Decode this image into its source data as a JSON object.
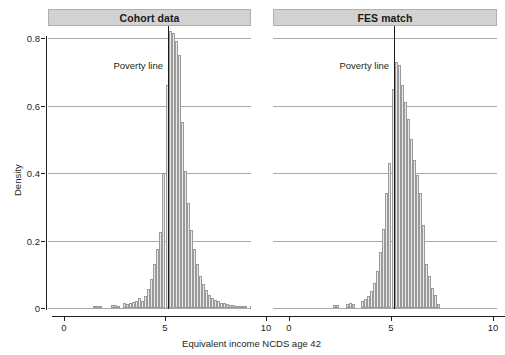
{
  "figure": {
    "width": 503,
    "height": 355,
    "background": "#ffffff",
    "bar_fill": "#e9e9e9",
    "bar_stroke": "#9a9a9a",
    "strip_fill": "#d2d2d2",
    "grid_color": "#a9a9a9",
    "axis_color": "#231f20"
  },
  "chart_data": {
    "type": "bar",
    "title": "",
    "subtitle": "",
    "xlabel": "Equivalent income NCDS age 42",
    "ylabel": "Density",
    "xlim": [
      -0.35,
      10.6
    ],
    "ylim": [
      0,
      0.86
    ],
    "xticks": [
      0,
      5,
      10
    ],
    "xtick_labels": [
      "0",
      "5",
      "10"
    ],
    "yticks": [
      0,
      0.2,
      0.4,
      0.6,
      0.8
    ],
    "ytick_labels": [
      "0",
      "0.2",
      "0.4",
      "0.6",
      "0.8"
    ],
    "grid": "horizontal",
    "legend": "none",
    "bin_width": 0.15,
    "annotations": [
      {
        "text": "Poverty line",
        "panel": "Cohort data",
        "x": 5.15,
        "type": "vline-label"
      },
      {
        "text": "Poverty line",
        "panel": "FES match",
        "x": 5.15,
        "type": "vline-label"
      }
    ],
    "poverty_line_x": 5.15,
    "panels": [
      {
        "label": "Cohort data",
        "x": [
          1.5,
          1.65,
          1.8,
          2.4,
          2.55,
          2.7,
          3.0,
          3.15,
          3.3,
          3.45,
          3.6,
          3.75,
          3.9,
          4.05,
          4.2,
          4.35,
          4.5,
          4.65,
          4.8,
          4.95,
          5.1,
          5.25,
          5.4,
          5.55,
          5.7,
          5.85,
          6.0,
          6.15,
          6.3,
          6.45,
          6.6,
          6.75,
          6.9,
          7.05,
          7.2,
          7.35,
          7.5,
          7.65,
          7.8,
          7.95,
          8.1,
          8.25,
          8.4,
          8.55,
          8.7,
          8.85,
          9.0,
          9.3,
          9.6,
          9.9
        ],
        "y": [
          0.006,
          0.004,
          0.005,
          0.01,
          0.008,
          0.006,
          0.014,
          0.012,
          0.016,
          0.018,
          0.02,
          0.03,
          0.022,
          0.035,
          0.055,
          0.085,
          0.13,
          0.175,
          0.225,
          0.4,
          0.66,
          0.82,
          0.815,
          0.79,
          0.75,
          0.55,
          0.405,
          0.31,
          0.23,
          0.175,
          0.13,
          0.095,
          0.07,
          0.052,
          0.04,
          0.03,
          0.024,
          0.02,
          0.016,
          0.014,
          0.012,
          0.01,
          0.008,
          0.007,
          0.006,
          0.005,
          0.004,
          0.003,
          0.003,
          0.002
        ]
      },
      {
        "label": "FES match",
        "x": [
          2.25,
          2.4,
          2.85,
          3.0,
          3.15,
          3.6,
          3.75,
          3.9,
          4.05,
          4.2,
          4.35,
          4.5,
          4.65,
          4.8,
          4.95,
          5.1,
          5.25,
          5.4,
          5.55,
          5.7,
          5.85,
          6.0,
          6.15,
          6.3,
          6.45,
          6.6,
          6.75,
          6.9,
          7.05,
          7.2,
          7.35
        ],
        "y": [
          0.01,
          0.009,
          0.012,
          0.014,
          0.011,
          0.02,
          0.026,
          0.035,
          0.05,
          0.075,
          0.11,
          0.165,
          0.235,
          0.34,
          0.43,
          0.65,
          0.73,
          0.72,
          0.66,
          0.61,
          0.56,
          0.5,
          0.44,
          0.395,
          0.34,
          0.245,
          0.13,
          0.095,
          0.06,
          0.04,
          0.012
        ]
      }
    ]
  },
  "panel_titles": {
    "left": "Cohort data",
    "right": "FES match"
  },
  "axes": {
    "y_title": "Density",
    "x_title": "Equivalent income NCDS age 42"
  },
  "labels": {
    "poverty_line": "Poverty line"
  }
}
